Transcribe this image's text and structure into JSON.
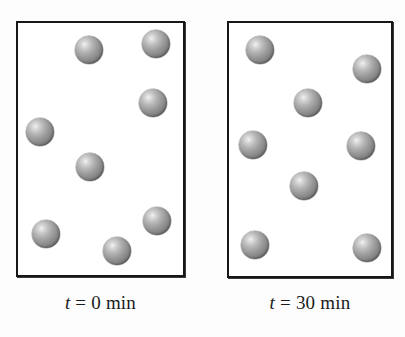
{
  "figure": {
    "name": "diffusion-two-panel-figure",
    "background_color": "#fdfdfd",
    "width": 405,
    "height": 337
  },
  "style": {
    "box_border_color": "#17171a",
    "box_fill_color": "#ffffff",
    "particle_color": "#8a8a8a",
    "particle_highlight_color": "#f2f2f2",
    "particle_shadow_color": "#565656",
    "label_color": "#1b1b1b"
  },
  "panels": [
    {
      "id": "panel-left",
      "label": {
        "variable": "t",
        "equals": "=",
        "value": "0",
        "unit": "min",
        "full_text": "t = 0 min"
      },
      "box": {
        "x": 16,
        "y": 21,
        "width": 169,
        "height": 256
      },
      "particle_count": 8,
      "particles": [
        {
          "cx": 89,
          "cy": 50,
          "r": 14
        },
        {
          "cx": 156,
          "cy": 44,
          "r": 14
        },
        {
          "cx": 153,
          "cy": 103,
          "r": 14
        },
        {
          "cx": 40,
          "cy": 132,
          "r": 14
        },
        {
          "cx": 90,
          "cy": 167,
          "r": 14
        },
        {
          "cx": 157,
          "cy": 221,
          "r": 14
        },
        {
          "cx": 46,
          "cy": 234,
          "r": 14
        },
        {
          "cx": 117,
          "cy": 251,
          "r": 14
        }
      ]
    },
    {
      "id": "panel-right",
      "label": {
        "variable": "t",
        "equals": "=",
        "value": "30",
        "unit": "min",
        "full_text": "t = 30 min"
      },
      "box": {
        "x": 227,
        "y": 21,
        "width": 166,
        "height": 257
      },
      "particle_count": 8,
      "particles": [
        {
          "cx": 260,
          "cy": 50,
          "r": 14
        },
        {
          "cx": 367,
          "cy": 69,
          "r": 14
        },
        {
          "cx": 308,
          "cy": 103,
          "r": 14
        },
        {
          "cx": 253,
          "cy": 145,
          "r": 14
        },
        {
          "cx": 361,
          "cy": 146,
          "r": 14
        },
        {
          "cx": 304,
          "cy": 186,
          "r": 14
        },
        {
          "cx": 255,
          "cy": 245,
          "r": 14
        },
        {
          "cx": 367,
          "cy": 248,
          "r": 14
        }
      ]
    }
  ],
  "label_positions": [
    {
      "x": 16,
      "y": 292,
      "width": 169
    },
    {
      "x": 227,
      "y": 292,
      "width": 166
    }
  ]
}
